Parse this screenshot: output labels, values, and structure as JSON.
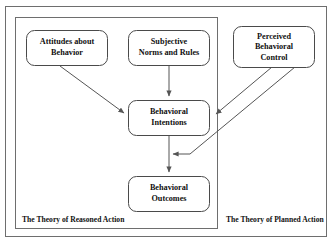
{
  "figure": {
    "background_color": "#ffffff",
    "frame_color": "#6e6e6e",
    "box_stroke_color": "#4a4a4a",
    "connector_color": "#555555",
    "text_color": "#101010"
  },
  "nodes": {
    "attitudes": {
      "line1": "Attitudes about",
      "line2": "Behavior"
    },
    "norms": {
      "line1": "Subjective",
      "line2": "Norms and Rules"
    },
    "control": {
      "line1": "Perceived",
      "line2": "Behavioral",
      "line3": "Control"
    },
    "intentions": {
      "line1": "Behavioral",
      "line2": "Intentions"
    },
    "outcomes": {
      "line1": "Behavioral",
      "line2": "Outcomes"
    }
  },
  "captions": {
    "reasoned_action": "The Theory of Reasoned Action",
    "planned_action": "The Theory of Planned Action"
  }
}
